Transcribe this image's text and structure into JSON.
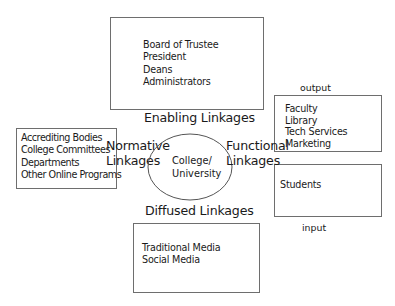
{
  "diagram": {
    "center": {
      "label": [
        "College/",
        "University"
      ]
    },
    "enabling": {
      "title": "Enabling Linkages",
      "items": [
        "Board of Trustee",
        "President",
        "Deans",
        "Administrators"
      ]
    },
    "normative": {
      "title": [
        "Normative",
        "Linkages"
      ],
      "items": [
        "Accrediting Bodies",
        "College Committees",
        "Departments",
        "Other Online Programs"
      ]
    },
    "functional": {
      "title": [
        "Functional",
        "Linkages"
      ],
      "output_label": "output",
      "output_items": [
        "Faculty",
        "Library",
        "Tech Services",
        "Marketing"
      ],
      "input_items": [
        "Students"
      ],
      "input_label": "input"
    },
    "diffused": {
      "title": "Diffused Linkages",
      "items": [
        "Traditional Media",
        "Social Media"
      ]
    }
  }
}
